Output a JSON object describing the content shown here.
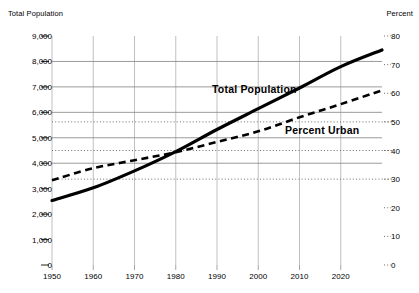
{
  "chart_data": {
    "type": "line",
    "title": "",
    "xlabel": "",
    "left_axis": {
      "label": "Total Population",
      "ticks": [
        "0",
        "1,000",
        "2,000",
        "3,000",
        "4,000",
        "5,000",
        "6,000",
        "7,000",
        "8,000",
        "9,000"
      ],
      "tick_values": [
        0,
        1000,
        2000,
        3000,
        4000,
        5000,
        6000,
        7000,
        8000,
        9000
      ],
      "ylim": [
        0,
        9000
      ],
      "gridline_values": [
        4000,
        5000,
        6000,
        7000,
        8000
      ]
    },
    "right_axis": {
      "label": "Percent",
      "ticks": [
        "0",
        "10",
        "20",
        "30",
        "40",
        "50",
        "60",
        "70",
        "80"
      ],
      "tick_values": [
        0,
        10,
        20,
        30,
        40,
        50,
        60,
        70,
        80
      ],
      "ylim": [
        0,
        80
      ],
      "gridline_values": [
        30,
        40,
        50
      ]
    },
    "x": [
      1950,
      1960,
      1970,
      1980,
      1990,
      2000,
      2010,
      2020,
      2030
    ],
    "xticks": [
      "1950",
      "1960",
      "1970",
      "1980",
      "1990",
      "2000",
      "2010",
      "2020"
    ],
    "xtick_values": [
      1950,
      1960,
      1970,
      1980,
      1990,
      2000,
      2010,
      2020
    ],
    "xlim": [
      1950,
      2030
    ],
    "grid": true,
    "legend": "inline-labels",
    "series": [
      {
        "name": "Total Population",
        "axis": "left",
        "style": "solid",
        "color": "#000000",
        "unit": "millions",
        "values": [
          2536,
          3032,
          3700,
          4458,
          5327,
          6143,
          6957,
          7795,
          8450
        ]
      },
      {
        "name": "Percent Urban",
        "axis": "right",
        "style": "dashed",
        "color": "#000000",
        "unit": "percent",
        "values": [
          29.6,
          33.8,
          36.6,
          39.4,
          43.0,
          46.7,
          51.6,
          56.2,
          61.0
        ]
      }
    ]
  }
}
